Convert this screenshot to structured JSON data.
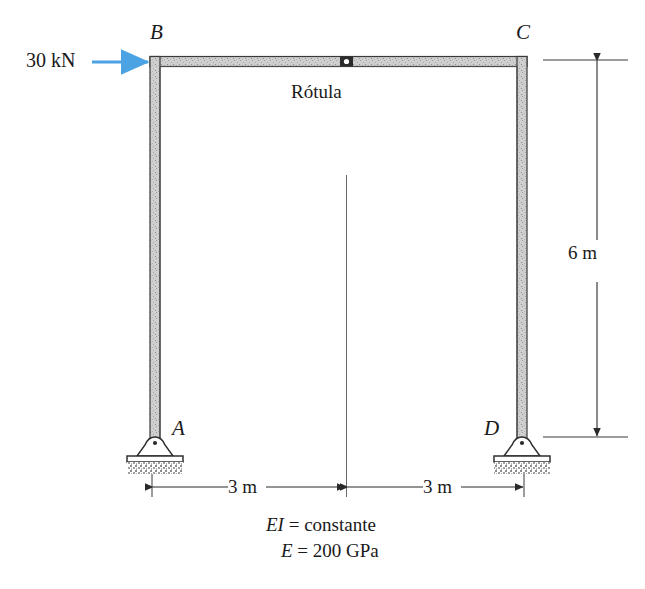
{
  "figure": {
    "type": "structural-frame-diagram"
  },
  "load": {
    "label": "30 kN",
    "magnitude": 30,
    "unit": "kN",
    "direction": "right",
    "applied_at": "B",
    "arrow_color": "#4ba3e3"
  },
  "nodes": {
    "b": "B",
    "c": "C",
    "a": "A",
    "d": "D"
  },
  "hinge": {
    "label": "Rótula",
    "marker": "hinge-dot"
  },
  "dimensions": {
    "left_span": "3 m",
    "right_span": "3 m",
    "height": "6 m"
  },
  "notes": {
    "stiffness_symbol": "EI",
    "stiffness_eq": "=",
    "stiffness_value": "constante",
    "modulus_symbol": "E",
    "modulus_eq": "=",
    "modulus_value": "200 GPa"
  },
  "supports": {
    "a_type": "pin-support",
    "d_type": "pin-support"
  },
  "colors": {
    "member_fill": "#c9c9c9",
    "member_edge": "#3a3a3a",
    "ink": "#1a1a1a",
    "arrow": "#4ba3e3"
  }
}
